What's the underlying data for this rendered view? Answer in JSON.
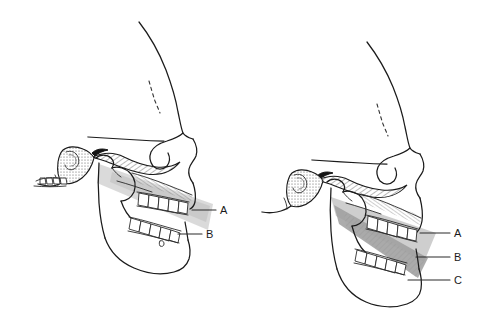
{
  "figure": {
    "type": "anatomical-line-diagram",
    "background_color": "#ffffff",
    "ink_color": "#1b1b1b",
    "panels": [
      {
        "id": "left",
        "name": "normal-occlusion-skull",
        "description": "Lateral view of skull with mandible in normal occlusion; shaded wedge passes through the occlusal plane",
        "shading": {
          "name": "occlusal-wedge-shading",
          "color": "#c9c9c9",
          "opacity": 0.75
        },
        "labels": [
          {
            "key": "A",
            "text": "A",
            "x": 222,
            "y": 212,
            "leader_from_x": 196,
            "leader_from_y": 210
          },
          {
            "key": "B",
            "text": "B",
            "x": 208,
            "y": 237,
            "leader_from_x": 182,
            "leader_from_y": 233
          }
        ]
      },
      {
        "id": "right",
        "name": "open-bite-skull",
        "description": "Lateral view of skull with anterior open bite; enlarged dark shaded wedge separates upper and lower dental arches",
        "shading": {
          "name": "open-bite-wedge-shading",
          "color": "#a0a0a0",
          "opacity": 0.85
        },
        "labels": [
          {
            "key": "A",
            "text": "A",
            "x": 458,
            "y": 235,
            "leader_from_x": 430,
            "leader_from_y": 233
          },
          {
            "key": "B",
            "text": "B",
            "x": 458,
            "y": 259,
            "leader_from_x": 428,
            "leader_from_y": 257
          },
          {
            "key": "C",
            "text": "C",
            "x": 458,
            "y": 282,
            "leader_from_x": 428,
            "leader_from_y": 280
          }
        ]
      }
    ]
  }
}
